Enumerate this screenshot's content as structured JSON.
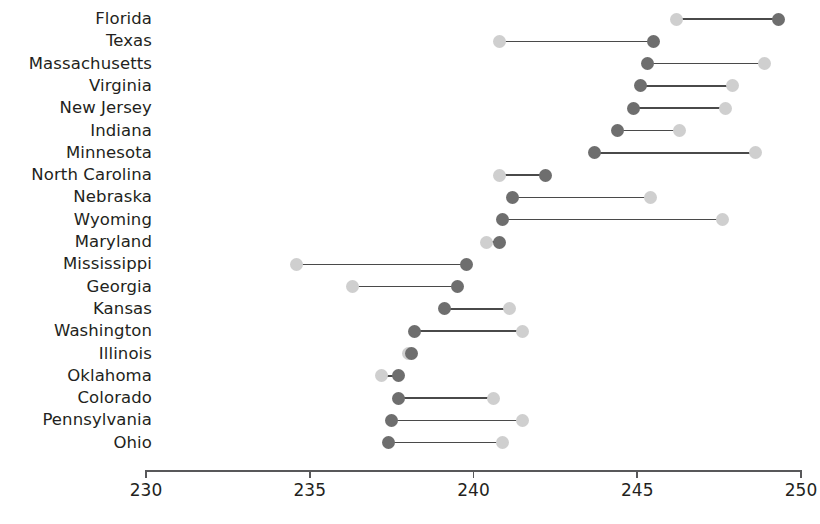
{
  "chart_data": {
    "type": "dumbbell",
    "title": "",
    "subtitle": "",
    "xlabel": "",
    "ylabel": "",
    "xlim": [
      230,
      250
    ],
    "xticks": [
      230,
      235,
      240,
      245,
      250
    ],
    "xtick_labels": [
      "230",
      "235",
      "240",
      "245",
      "250"
    ],
    "grid": false,
    "legend": [],
    "legend_position": "none",
    "orientation": "horizontal",
    "series": [
      {
        "name": "light",
        "color": "#cfcfcf"
      },
      {
        "name": "dark",
        "color": "#6e6e6e"
      }
    ],
    "categories": [
      "Florida",
      "Texas",
      "Massachusetts",
      "Virginia",
      "New Jersey",
      "Indiana",
      "Minnesota",
      "North Carolina",
      "Nebraska",
      "Wyoming",
      "Maryland",
      "Mississippi",
      "Georgia",
      "Kansas",
      "Washington",
      "Illinois",
      "Oklahoma",
      "Colorado",
      "Pennsylvania",
      "Ohio"
    ],
    "rows": [
      {
        "category": "Florida",
        "light": 246.2,
        "dark": 249.3
      },
      {
        "category": "Texas",
        "light": 240.8,
        "dark": 245.5
      },
      {
        "category": "Massachusetts",
        "light": 248.9,
        "dark": 245.3
      },
      {
        "category": "Virginia",
        "light": 247.9,
        "dark": 245.1
      },
      {
        "category": "New Jersey",
        "light": 247.7,
        "dark": 244.9
      },
      {
        "category": "Indiana",
        "light": 246.3,
        "dark": 244.4
      },
      {
        "category": "Minnesota",
        "light": 248.6,
        "dark": 243.7
      },
      {
        "category": "North Carolina",
        "light": 240.8,
        "dark": 242.2
      },
      {
        "category": "Nebraska",
        "light": 245.4,
        "dark": 241.2
      },
      {
        "category": "Wyoming",
        "light": 247.6,
        "dark": 240.9
      },
      {
        "category": "Maryland",
        "light": 240.4,
        "dark": 240.8
      },
      {
        "category": "Mississippi",
        "light": 234.6,
        "dark": 239.8
      },
      {
        "category": "Georgia",
        "light": 236.3,
        "dark": 239.5
      },
      {
        "category": "Kansas",
        "light": 241.1,
        "dark": 239.1
      },
      {
        "category": "Washington",
        "light": 241.5,
        "dark": 238.2
      },
      {
        "category": "Illinois",
        "light": 238.0,
        "dark": 238.1
      },
      {
        "category": "Oklahoma",
        "light": 237.2,
        "dark": 237.7
      },
      {
        "category": "Colorado",
        "light": 240.6,
        "dark": 237.7
      },
      {
        "category": "Pennsylvania",
        "light": 241.5,
        "dark": 237.5
      },
      {
        "category": "Ohio",
        "light": 240.9,
        "dark": 237.4
      }
    ]
  }
}
